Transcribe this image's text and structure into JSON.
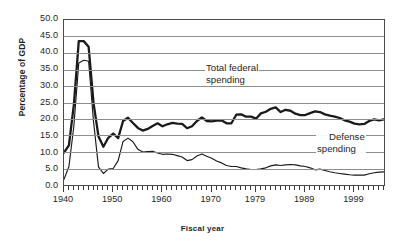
{
  "chart_data": {
    "type": "line",
    "title": "",
    "xlabel": "Fiscal year",
    "ylabel": "Percentage of GDP",
    "xlim": [
      1940,
      2005
    ],
    "ylim": [
      0.0,
      50.0
    ],
    "grid": true,
    "legend_position": "inline-annotation",
    "ytick_labels": [
      "50.0",
      "45.0",
      "40.0",
      "35.0",
      "30.0",
      "25.0",
      "20.0",
      "15.0",
      "10.0",
      "5.0",
      "0.0"
    ],
    "ytick_values": [
      50.0,
      45.0,
      40.0,
      35.0,
      30.0,
      25.0,
      20.0,
      15.0,
      10.0,
      5.0,
      0.0
    ],
    "xtick_labels": [
      "1940",
      "1950",
      "1960",
      "1970",
      "1979",
      "1989",
      "1999"
    ],
    "xtick_values": [
      1940,
      1950,
      1960,
      1970,
      1979,
      1989,
      1999
    ],
    "annotations": [
      {
        "name": "total-federal-spending",
        "line1": "Total federal",
        "line2": "spending"
      },
      {
        "name": "defense-spending",
        "line1": "Defense",
        "line2": "spending"
      }
    ],
    "x": [
      1940,
      1941,
      1942,
      1943,
      1944,
      1945,
      1946,
      1947,
      1948,
      1949,
      1950,
      1951,
      1952,
      1953,
      1954,
      1955,
      1956,
      1957,
      1958,
      1959,
      1960,
      1961,
      1962,
      1963,
      1964,
      1965,
      1966,
      1967,
      1968,
      1969,
      1970,
      1971,
      1972,
      1973,
      1974,
      1975,
      1976,
      1977,
      1978,
      1979,
      1980,
      1981,
      1982,
      1983,
      1984,
      1985,
      1986,
      1987,
      1988,
      1989,
      1990,
      1991,
      1992,
      1993,
      1994,
      1995,
      1996,
      1997,
      1998,
      1999,
      2000,
      2001,
      2002,
      2003,
      2004,
      2005
    ],
    "series": [
      {
        "name": "Total federal spending",
        "values": [
          9.8,
          12.0,
          24.3,
          43.6,
          43.6,
          41.9,
          24.8,
          14.8,
          11.6,
          14.3,
          15.6,
          14.2,
          19.4,
          20.4,
          18.8,
          17.3,
          16.5,
          17.0,
          17.9,
          18.7,
          17.8,
          18.4,
          18.8,
          18.6,
          18.5,
          17.2,
          17.8,
          19.4,
          20.5,
          19.4,
          19.3,
          19.5,
          19.6,
          18.7,
          18.7,
          21.3,
          21.4,
          20.7,
          20.7,
          20.1,
          21.7,
          22.2,
          23.1,
          23.5,
          22.1,
          22.8,
          22.5,
          21.6,
          21.2,
          21.2,
          21.8,
          22.3,
          22.1,
          21.4,
          21.0,
          20.7,
          20.3,
          19.6,
          19.2,
          18.6,
          18.4,
          18.5,
          19.4,
          19.9,
          19.6,
          19.9
        ]
      },
      {
        "name": "Defense spending",
        "values": [
          1.7,
          5.6,
          17.8,
          37.0,
          37.8,
          37.5,
          19.2,
          5.5,
          3.5,
          4.8,
          5.0,
          7.4,
          13.2,
          14.2,
          13.1,
          10.8,
          10.0,
          10.1,
          10.2,
          9.7,
          9.3,
          9.4,
          9.3,
          8.9,
          8.5,
          7.4,
          7.7,
          8.8,
          9.4,
          8.7,
          8.1,
          7.3,
          6.7,
          5.9,
          5.6,
          5.6,
          5.2,
          4.9,
          4.7,
          4.7,
          4.9,
          5.2,
          5.8,
          6.1,
          5.9,
          6.1,
          6.2,
          6.1,
          5.8,
          5.6,
          5.2,
          4.6,
          4.8,
          4.4,
          4.0,
          3.7,
          3.5,
          3.3,
          3.1,
          3.0,
          3.0,
          3.0,
          3.4,
          3.7,
          3.9,
          4.0
        ]
      }
    ]
  },
  "axis": {
    "y_title": "Percentage of GDP",
    "x_title": "Fiscal year"
  },
  "labels": {
    "total_line1": "Total federal",
    "total_line2": "spending",
    "defense_line1": "Defense",
    "defense_line2": "spending"
  },
  "colors": {
    "line": "#1a1a1a",
    "grid": "#8d8d8d",
    "frame": "#4a4a4a",
    "background": "#ffffff"
  }
}
